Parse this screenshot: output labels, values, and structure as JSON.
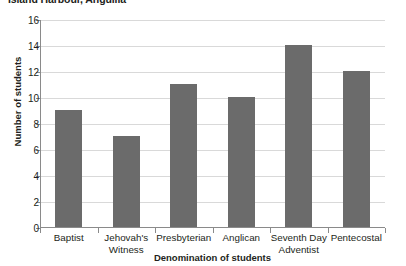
{
  "chart_data": {
    "type": "bar",
    "title": "Island Harbour, Anguilla",
    "xlabel": "Denomination of students",
    "ylabel": "Number of students",
    "categories": [
      "Baptist",
      "Jehovah's Witness",
      "Presbyterian",
      "Anglican",
      "Seventh Day Adventist",
      "Pentecostal"
    ],
    "values": [
      9,
      7,
      11,
      10,
      14,
      12
    ],
    "ylim": [
      0,
      16
    ],
    "ytick_step": 2,
    "yticks": [
      "16",
      "14",
      "12",
      "10",
      "8",
      "6",
      "4",
      "2",
      "0"
    ],
    "grid": true,
    "legend": false,
    "bar_color": "#6b6b6b",
    "gridline_color": "#d9d9d9",
    "axis_color": "#8a8a8a",
    "background_color": "#ffffff"
  }
}
